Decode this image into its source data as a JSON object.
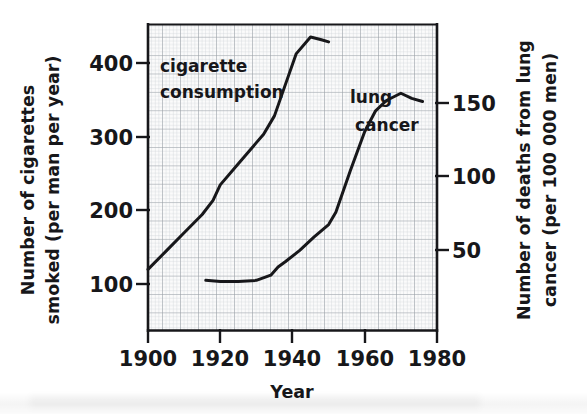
{
  "chart_data": {
    "type": "line",
    "title": "",
    "xlabel": "Year",
    "ylabel_left": "Number of cigarettes smoked (per man per year)",
    "ylabel_right": "Number of deaths from lung cancer (per 100 000 men)",
    "xlim": [
      1900,
      1980
    ],
    "xticks": [
      1900,
      1920,
      1940,
      1960,
      1980
    ],
    "xticklabels": [
      "1900",
      "1920",
      "1940",
      "1960",
      "1980"
    ],
    "ylim_left": [
      12,
      445
    ],
    "yticks_left": [
      100,
      200,
      300,
      400
    ],
    "yticklabels_left": [
      "100",
      "200",
      "300",
      "400"
    ],
    "ylim_right": [
      -44,
      251
    ],
    "yticks_right": [
      50,
      100,
      150
    ],
    "yticklabels_right": [
      "50",
      "100",
      "150"
    ],
    "grid": true,
    "grid_minor_step_x": 1,
    "grid_major_step_x": 5,
    "legend": "inline-annotations",
    "series": [
      {
        "name": "cigarette consumption",
        "axis": "left",
        "label_text": [
          "cigarette",
          "consumption"
        ],
        "label_x": 1903,
        "label_y": 385,
        "points": [
          {
            "x": 1900,
            "y": 98
          },
          {
            "x": 1905,
            "y": 124
          },
          {
            "x": 1910,
            "y": 150
          },
          {
            "x": 1915,
            "y": 176
          },
          {
            "x": 1918,
            "y": 196
          },
          {
            "x": 1920,
            "y": 218
          },
          {
            "x": 1925,
            "y": 248
          },
          {
            "x": 1930,
            "y": 278
          },
          {
            "x": 1932,
            "y": 290
          },
          {
            "x": 1935,
            "y": 316
          },
          {
            "x": 1938,
            "y": 360
          },
          {
            "x": 1941,
            "y": 404
          },
          {
            "x": 1945,
            "y": 428
          },
          {
            "x": 1948,
            "y": 424
          },
          {
            "x": 1950,
            "y": 421
          }
        ]
      },
      {
        "name": "lung cancer",
        "axis": "right",
        "label_text": [
          "lung",
          "cancer"
        ],
        "label_x": 1952,
        "label_y": 148,
        "points": [
          {
            "x": 1916,
            "y": 4
          },
          {
            "x": 1920,
            "y": 3
          },
          {
            "x": 1925,
            "y": 3
          },
          {
            "x": 1930,
            "y": 4
          },
          {
            "x": 1934,
            "y": 9
          },
          {
            "x": 1936,
            "y": 17
          },
          {
            "x": 1938,
            "y": 22
          },
          {
            "x": 1942,
            "y": 33
          },
          {
            "x": 1946,
            "y": 46
          },
          {
            "x": 1950,
            "y": 58
          },
          {
            "x": 1952,
            "y": 70
          },
          {
            "x": 1956,
            "y": 110
          },
          {
            "x": 1960,
            "y": 148
          },
          {
            "x": 1963,
            "y": 168
          },
          {
            "x": 1966,
            "y": 178
          },
          {
            "x": 1970,
            "y": 185
          },
          {
            "x": 1973,
            "y": 180
          },
          {
            "x": 1976,
            "y": 177
          }
        ]
      }
    ]
  },
  "colors": {
    "curve": "#17171a",
    "axis": "#17171a",
    "grid_minor": "#c9cdd2",
    "grid_major": "#9aa0a7",
    "plot_bg": "#fbfbfb",
    "page_bg": "#ffffff"
  }
}
